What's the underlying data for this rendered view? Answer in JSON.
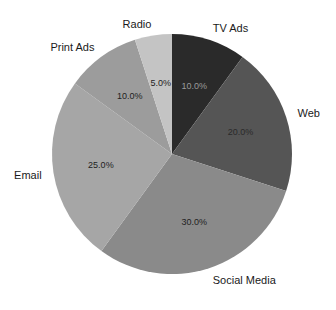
{
  "chart_data": {
    "type": "pie",
    "title": "",
    "start_angle": 90,
    "direction": "clockwise",
    "autopct_format": "%.1f%%",
    "legend": "none",
    "slices": [
      {
        "label": "TV Ads",
        "value": 10.0,
        "pct_label": "10.0%",
        "color": "#2a2a2a",
        "pct_color": "#9a9a9a"
      },
      {
        "label": "Web",
        "value": 20.0,
        "pct_label": "20.0%",
        "color": "#555555",
        "pct_color": "#2a2a2a"
      },
      {
        "label": "Social Media",
        "value": 30.0,
        "pct_label": "30.0%",
        "color": "#8a8a8a",
        "pct_color": "#222222"
      },
      {
        "label": "Email",
        "value": 25.0,
        "pct_label": "25.0%",
        "color": "#a6a6a6",
        "pct_color": "#222222"
      },
      {
        "label": "Print Ads",
        "value": 10.0,
        "pct_label": "10.0%",
        "color": "#9c9c9c",
        "pct_color": "#222222"
      },
      {
        "label": "Radio",
        "value": 5.0,
        "pct_label": "5.0%",
        "color": "#c4c4c4",
        "pct_color": "#222222"
      }
    ]
  },
  "geometry": {
    "cx": 172,
    "cy": 154,
    "r": 120,
    "label_r": 1.1,
    "pct_r": 0.6
  }
}
